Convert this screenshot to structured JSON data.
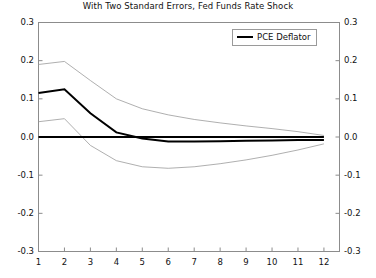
{
  "chart_data": {
    "type": "line",
    "title": "With Two Standard Errors, Fed Funds Rate Shock",
    "xlabel": "",
    "ylabel": "",
    "xlim": [
      1,
      12.6
    ],
    "ylim": [
      -0.3,
      0.3
    ],
    "grid": false,
    "legend_position": "top-right",
    "x": [
      1,
      2,
      3,
      4,
      5,
      6,
      7,
      8,
      9,
      10,
      11,
      12
    ],
    "xticks": [
      "1",
      "2",
      "3",
      "4",
      "5",
      "6",
      "7",
      "8",
      "9",
      "10",
      "11",
      "12"
    ],
    "yticks": [
      "0.3",
      "0.2",
      "0.1",
      "0.0",
      "-0.1",
      "-0.2",
      "-0.3"
    ],
    "ytick_values": [
      0.3,
      0.2,
      0.1,
      0.0,
      -0.1,
      -0.2,
      -0.3
    ],
    "right_axis_labels": [
      "0.3",
      "0.2",
      "0.1",
      "0.0",
      "-0.1",
      "-0.2",
      "-0.3"
    ],
    "series": [
      {
        "name": "PCE Deflator",
        "style": "thick-solid-black",
        "color": "#000000",
        "values": [
          0.115,
          0.125,
          0.062,
          0.012,
          -0.004,
          -0.012,
          -0.012,
          -0.011,
          -0.01,
          -0.009,
          -0.008,
          -0.008
        ]
      },
      {
        "name": "Upper Two Standard Error Band",
        "style": "thin-solid-gray",
        "color": "#9a9a9a",
        "values": [
          0.19,
          0.198,
          0.148,
          0.1,
          0.074,
          0.058,
          0.046,
          0.037,
          0.029,
          0.022,
          0.014,
          0.004
        ]
      },
      {
        "name": "Lower Two Standard Error Band",
        "style": "thin-solid-gray",
        "color": "#9a9a9a",
        "values": [
          0.04,
          0.048,
          -0.022,
          -0.062,
          -0.078,
          -0.082,
          -0.078,
          -0.07,
          -0.06,
          -0.048,
          -0.034,
          -0.018
        ]
      },
      {
        "name": "Zero Reference Line",
        "style": "thick-solid-black",
        "color": "#000000",
        "values": [
          0.0,
          0.0,
          0.0,
          0.0,
          0.0,
          0.0,
          0.0,
          0.0,
          0.0,
          0.0,
          0.0,
          0.0
        ]
      }
    ],
    "legend": [
      {
        "label": "PCE Deflator",
        "color": "#000000"
      }
    ]
  },
  "legend": {
    "entry_label": "PCE Deflator"
  },
  "colors": {
    "main_line": "#000000",
    "error_band": "#9a9a9a",
    "axis": "#8c8c8c",
    "text": "#111111",
    "background": "#ffffff"
  }
}
